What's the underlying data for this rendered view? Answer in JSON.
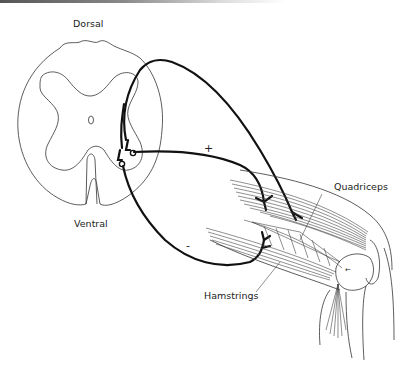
{
  "diagram": {
    "labels": {
      "dorsal": "Dorsal",
      "ventral": "Ventral",
      "quadriceps": "Quadriceps",
      "hamstrings": "Hamstrings",
      "excitatory_sign": "+",
      "inhibitory_sign": "-"
    },
    "colors": {
      "line": "#111111",
      "background": "#ffffff"
    }
  }
}
